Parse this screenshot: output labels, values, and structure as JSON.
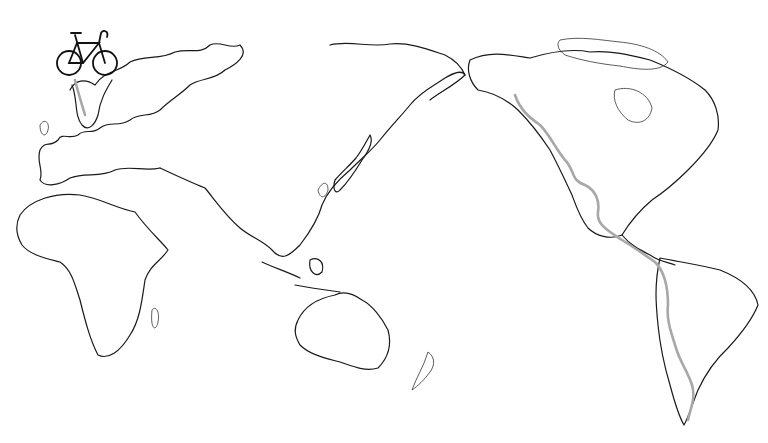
{
  "illustration": {
    "subject": "hand-drawn world map with bicycle route",
    "background_color": "#ffffff",
    "coastline_color": "#1a1a1a",
    "route_color": "#a8a8a8",
    "icons": [
      "bicycle-icon"
    ],
    "regions": [
      "europe",
      "africa",
      "asia",
      "japan",
      "indonesia",
      "australia",
      "new-zealand",
      "north-america",
      "central-america",
      "south-america",
      "greenland"
    ]
  }
}
